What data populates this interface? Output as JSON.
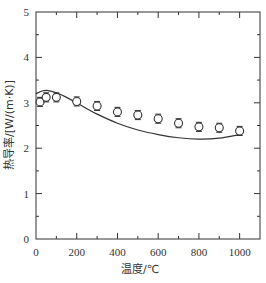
{
  "chart_data": {
    "type": "scatter",
    "title": "",
    "xlabel": "温度/℃",
    "ylabel": "热导率/[W/(m·K)]",
    "xlim": [
      0,
      1100
    ],
    "ylim": [
      0,
      5
    ],
    "x_ticks": [
      0,
      200,
      400,
      600,
      800,
      1000
    ],
    "y_ticks": [
      0,
      1,
      2,
      3,
      4,
      5
    ],
    "grid": false,
    "legend": null,
    "series": [
      {
        "name": "measured",
        "style": "open-circle-with-errorbars",
        "x": [
          20,
          50,
          100,
          200,
          300,
          400,
          500,
          600,
          700,
          800,
          900,
          1000
        ],
        "y": [
          3.02,
          3.12,
          3.12,
          3.03,
          2.93,
          2.8,
          2.73,
          2.65,
          2.55,
          2.47,
          2.45,
          2.38
        ],
        "error": [
          0.1,
          0.1,
          0.1,
          0.1,
          0.1,
          0.1,
          0.1,
          0.1,
          0.1,
          0.1,
          0.1,
          0.1
        ]
      },
      {
        "name": "model",
        "style": "solid-line",
        "x": [
          0,
          30,
          60,
          100,
          150,
          200,
          250,
          300,
          400,
          500,
          600,
          700,
          800,
          900,
          1000
        ],
        "y": [
          3.2,
          3.26,
          3.27,
          3.22,
          3.12,
          3.0,
          2.87,
          2.75,
          2.55,
          2.4,
          2.3,
          2.23,
          2.2,
          2.22,
          2.3
        ]
      }
    ]
  }
}
